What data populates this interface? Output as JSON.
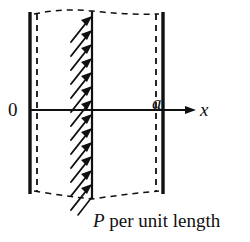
{
  "figure": {
    "labels": {
      "origin": "0",
      "right_boundary": "a",
      "axis": "x",
      "load_symbol": "P",
      "load_text": " per unit length"
    },
    "colors": {
      "ink": "#101010",
      "background": "#ffffff"
    },
    "geometry": {
      "left_wall_x": 30,
      "left_dashed_x": 37,
      "right_dashed_x": 156,
      "right_wall_x": 163,
      "load_line_x": 92,
      "axis_y": 110,
      "top_y": 14,
      "bottom_y": 196,
      "axis_arrow_tip_x": 196,
      "arrow_count": 13,
      "arrow_length": 26,
      "arrow_angle_deg": 52
    }
  }
}
